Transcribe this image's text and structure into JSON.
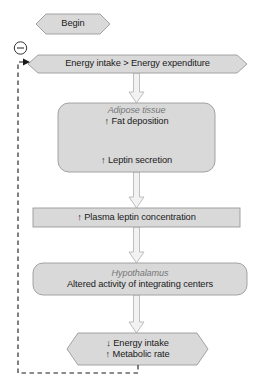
{
  "diagram": {
    "colors": {
      "node_fill": "#d9d9d9",
      "node_stroke": "#9a9a9a",
      "arrow_fill": "#f2f2f2",
      "arrow_stroke": "#b3b3b3",
      "text": "#1a1a1a",
      "organ_text": "#777777",
      "feedback_line": "#1a1a1a",
      "background": "#ffffff"
    },
    "nodes": [
      {
        "id": "begin",
        "shape": "hexagon",
        "lines": [
          "Begin"
        ]
      },
      {
        "id": "energy-balance",
        "shape": "hexagon",
        "lines": [
          "Energy intake > Energy expenditure"
        ]
      },
      {
        "id": "adipose-tissue",
        "shape": "rounded-rect",
        "organ": "Adipose tissue",
        "lines": [
          "↑ Fat deposition",
          "↑ Leptin secretion"
        ]
      },
      {
        "id": "plasma-leptin",
        "shape": "rect",
        "lines": [
          "↑ Plasma leptin concentration"
        ]
      },
      {
        "id": "hypothalamus",
        "shape": "rounded-rect",
        "organ": "Hypothalamus",
        "lines": [
          "Altered activity of integrating centers"
        ]
      },
      {
        "id": "outcome",
        "shape": "hexagon",
        "lines": [
          "↓ Energy intake",
          "↑ Metabolic rate"
        ]
      }
    ],
    "feedback": {
      "sign": "−",
      "sign_name": "negative-feedback",
      "style": "dashed",
      "from": "outcome",
      "to": "energy-balance"
    }
  }
}
